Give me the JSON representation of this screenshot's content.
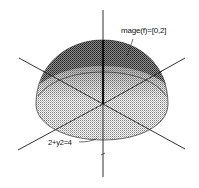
{
  "figure": {
    "labels": {
      "image": "mage(f)=[0,2]",
      "circle": "2+y2=4"
    },
    "colors": {
      "background": "#ffffff",
      "mesh_dark": "#222222",
      "mesh_light": "#9a9a9a",
      "axis": "#333333"
    }
  }
}
